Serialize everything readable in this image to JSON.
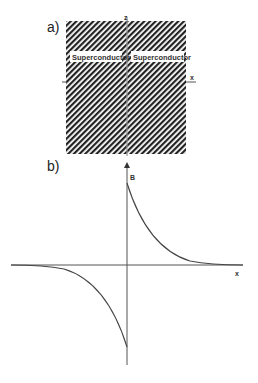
{
  "panel_a": {
    "label": "a)",
    "z_axis_label": "z",
    "x_axis_label": "x",
    "regions": [
      {
        "label": "Superconductor",
        "side": "left"
      },
      {
        "label": "Superconductor",
        "side": "right"
      }
    ]
  },
  "panel_b": {
    "label": "b)",
    "y_axis_label": "B",
    "x_axis_label": "x",
    "curve": "field B decays exponentially away from x=0: positive for x>0, negative (mirror) for x<0"
  },
  "colors": {
    "hatch": "#222222",
    "axis": "#555555",
    "curve": "#444444"
  }
}
